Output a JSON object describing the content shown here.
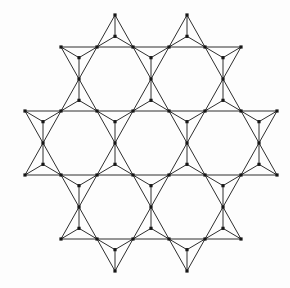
{
  "diagram": {
    "type": "kagome-lattice-corner-sharing-triangles",
    "canvas": {
      "width": 290,
      "height": 288,
      "background": "#fdfdfd"
    },
    "style": {
      "line_color": "#2e2e2e",
      "line_width": 1,
      "dot_color": "#161616",
      "dot_size": 3.2,
      "draw_centroid_spokes": true,
      "dot_on_centroid": true
    },
    "triangles": [
      {
        "v": [
          [
            97,
            47
          ],
          [
            133,
            47
          ],
          [
            115,
            15
          ]
        ]
      },
      {
        "v": [
          [
            169,
            47
          ],
          [
            205,
            47
          ],
          [
            187,
            15
          ]
        ]
      },
      {
        "v": [
          [
            61,
            47
          ],
          [
            97,
            47
          ],
          [
            79,
            79
          ]
        ]
      },
      {
        "v": [
          [
            133,
            47
          ],
          [
            169,
            47
          ],
          [
            151,
            79
          ]
        ]
      },
      {
        "v": [
          [
            205,
            47
          ],
          [
            241,
            47
          ],
          [
            223,
            79
          ]
        ]
      },
      {
        "v": [
          [
            61,
            111
          ],
          [
            97,
            111
          ],
          [
            79,
            79
          ]
        ]
      },
      {
        "v": [
          [
            133,
            111
          ],
          [
            169,
            111
          ],
          [
            151,
            79
          ]
        ]
      },
      {
        "v": [
          [
            205,
            111
          ],
          [
            241,
            111
          ],
          [
            223,
            79
          ]
        ]
      },
      {
        "v": [
          [
            25,
            111
          ],
          [
            61,
            111
          ],
          [
            43,
            143
          ]
        ]
      },
      {
        "v": [
          [
            97,
            111
          ],
          [
            133,
            111
          ],
          [
            115,
            143
          ]
        ]
      },
      {
        "v": [
          [
            169,
            111
          ],
          [
            205,
            111
          ],
          [
            187,
            143
          ]
        ]
      },
      {
        "v": [
          [
            241,
            111
          ],
          [
            277,
            111
          ],
          [
            259,
            143
          ]
        ]
      },
      {
        "v": [
          [
            25,
            175
          ],
          [
            61,
            175
          ],
          [
            43,
            143
          ]
        ]
      },
      {
        "v": [
          [
            97,
            175
          ],
          [
            133,
            175
          ],
          [
            115,
            143
          ]
        ]
      },
      {
        "v": [
          [
            169,
            175
          ],
          [
            205,
            175
          ],
          [
            187,
            143
          ]
        ]
      },
      {
        "v": [
          [
            241,
            175
          ],
          [
            277,
            175
          ],
          [
            259,
            143
          ]
        ]
      },
      {
        "v": [
          [
            61,
            175
          ],
          [
            97,
            175
          ],
          [
            79,
            207
          ]
        ]
      },
      {
        "v": [
          [
            133,
            175
          ],
          [
            169,
            175
          ],
          [
            151,
            207
          ]
        ]
      },
      {
        "v": [
          [
            205,
            175
          ],
          [
            241,
            175
          ],
          [
            223,
            207
          ]
        ]
      },
      {
        "v": [
          [
            61,
            239
          ],
          [
            97,
            239
          ],
          [
            79,
            207
          ]
        ]
      },
      {
        "v": [
          [
            133,
            239
          ],
          [
            169,
            239
          ],
          [
            151,
            207
          ]
        ]
      },
      {
        "v": [
          [
            205,
            239
          ],
          [
            241,
            239
          ],
          [
            223,
            207
          ]
        ]
      },
      {
        "v": [
          [
            97,
            239
          ],
          [
            133,
            239
          ],
          [
            115,
            271
          ]
        ]
      },
      {
        "v": [
          [
            169,
            239
          ],
          [
            205,
            239
          ],
          [
            187,
            271
          ]
        ]
      }
    ]
  }
}
